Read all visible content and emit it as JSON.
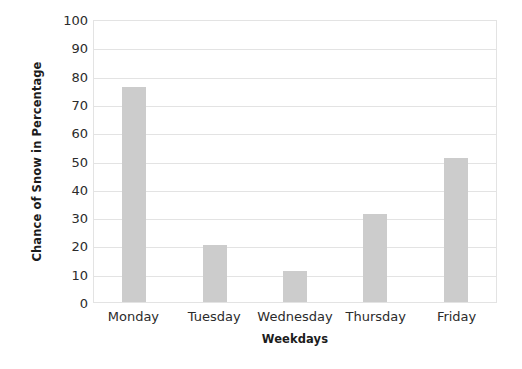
{
  "chart_data": {
    "type": "bar",
    "title": "",
    "categories": [
      "Monday",
      "Tuesday",
      "Wednesday",
      "Thursday",
      "Friday"
    ],
    "values": [
      76,
      20,
      11,
      31,
      51
    ],
    "series": [
      {
        "name": "Chance of Snow in Percentage",
        "values": [
          76,
          20,
          11,
          31,
          51
        ]
      }
    ],
    "xlabel": "Weekdays",
    "ylabel": "Chance of Snow in Percentage",
    "ylim": [
      0,
      100
    ],
    "ytick_step": 10,
    "yticks": [
      0,
      10,
      20,
      30,
      40,
      50,
      60,
      70,
      80,
      90,
      100
    ],
    "ytick_labels": [
      "0",
      "10",
      "20",
      "30",
      "40",
      "50",
      "60",
      "70",
      "80",
      "90",
      "100"
    ],
    "grid": true,
    "grid_axis": "y",
    "legend": false,
    "legend_position": "none",
    "bar_color": "#cccccc",
    "grid_color": "#e3e3e3",
    "axis_color": "#e3e3e3",
    "text_color": "#2b2b2b",
    "background_color": "#ffffff"
  }
}
